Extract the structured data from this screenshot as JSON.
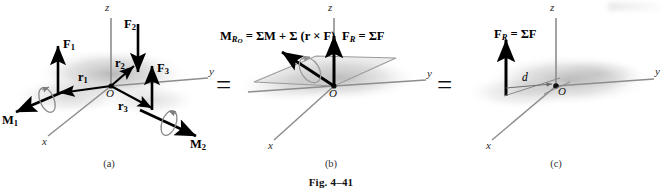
{
  "figure": {
    "caption": "Fig. 4–41",
    "panels": [
      {
        "id": "a",
        "label": "(a)",
        "axes": {
          "x": "x",
          "y": "y",
          "z": "z",
          "origin": "O"
        },
        "forces": [
          {
            "name": "F1",
            "symbol": "F",
            "subscript": "1"
          },
          {
            "name": "F2",
            "symbol": "F",
            "subscript": "2"
          },
          {
            "name": "F3",
            "symbol": "F",
            "subscript": "3"
          }
        ],
        "position_vectors": [
          {
            "name": "r1",
            "symbol": "r",
            "subscript": "1"
          },
          {
            "name": "r2",
            "symbol": "r",
            "subscript": "2"
          },
          {
            "name": "r3",
            "symbol": "r",
            "subscript": "3"
          }
        ],
        "couple_moments": [
          {
            "name": "M1",
            "symbol": "M",
            "subscript": "1"
          },
          {
            "name": "M2",
            "symbol": "M",
            "subscript": "2"
          }
        ]
      },
      {
        "id": "b",
        "label": "(b)",
        "axes": {
          "x": "x",
          "y": "y",
          "z": "z",
          "origin": "O"
        },
        "moment_equation": {
          "lhs_symbol": "M",
          "lhs_subscript": "R",
          "lhs_subsubscript": "O",
          "rhs": "= ΣM + Σ (r × F)"
        },
        "force_equation": {
          "lhs_symbol": "F",
          "lhs_subscript": "R",
          "rhs": "= ΣF"
        }
      },
      {
        "id": "c",
        "label": "(c)",
        "axes": {
          "x": "x",
          "y": "y",
          "z": "z",
          "origin": "O"
        },
        "force_equation": {
          "lhs_symbol": "F",
          "lhs_subscript": "R",
          "rhs": "= ΣF"
        },
        "distance_label": "d"
      }
    ],
    "equals_signs": [
      "=",
      "="
    ],
    "colors": {
      "vector_black": "#000000",
      "axis_gray": "#8a8a8a",
      "shadow_gray": "#9b9b9b",
      "text_black": "#141414"
    }
  }
}
